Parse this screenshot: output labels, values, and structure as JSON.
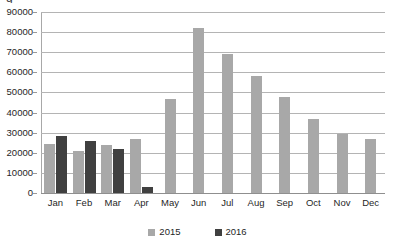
{
  "chart_data": {
    "type": "bar",
    "title": "",
    "xlabel": "",
    "ylabel": "",
    "ylim": [
      0,
      90000
    ],
    "ytick_step": 10000,
    "yticks": [
      "0",
      "10000",
      "20000",
      "30000",
      "40000",
      "50000",
      "60000",
      "70000",
      "80000",
      "90000"
    ],
    "grid": true,
    "legend_position": "bottom",
    "categories": [
      "Jan",
      "Feb",
      "Mar",
      "Apr",
      "May",
      "Jun",
      "Jul",
      "Aug",
      "Sep",
      "Oct",
      "Nov",
      "Dec"
    ],
    "series": [
      {
        "name": "2015",
        "color": "#a8a8a8",
        "values": [
          24200,
          21000,
          24100,
          26700,
          46500,
          82000,
          69000,
          58000,
          47500,
          37000,
          29500,
          27000
        ]
      },
      {
        "name": "2016",
        "color": "#404040",
        "values": [
          28300,
          26000,
          22100,
          3100,
          null,
          null,
          null,
          null,
          null,
          null,
          null,
          null
        ]
      }
    ]
  },
  "legend": {
    "items": [
      {
        "label": "2015",
        "series": "s2015"
      },
      {
        "label": "2016",
        "series": "s2016"
      }
    ]
  },
  "clipped_title": "g"
}
